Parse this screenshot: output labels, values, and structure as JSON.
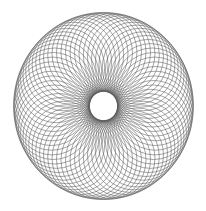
{
  "figure": {
    "type": "spirograph-circle-rosette",
    "width": 206,
    "height": 211,
    "background": "#ffffff",
    "stroke_color": "#5a5a5a",
    "stroke_width": 0.55,
    "center": [
      103.5,
      106
    ],
    "ring_radius": 52,
    "circle_radius": 38,
    "circle_count": 72,
    "y_scale": 1.04,
    "outer_radius_approx": 90,
    "inner_hole_radius_approx": 14
  }
}
